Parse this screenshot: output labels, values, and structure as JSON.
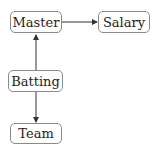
{
  "diagram": {
    "nodes": [
      {
        "id": "master",
        "label": "Master"
      },
      {
        "id": "salary",
        "label": "Salary"
      },
      {
        "id": "batting",
        "label": "Batting"
      },
      {
        "id": "team",
        "label": "Team"
      }
    ],
    "edges": [
      {
        "from": "master",
        "to": "salary"
      },
      {
        "from": "batting",
        "to": "master"
      },
      {
        "from": "batting",
        "to": "team"
      }
    ],
    "colors": {
      "line": "#333333",
      "border": "#8a8a8a"
    }
  }
}
